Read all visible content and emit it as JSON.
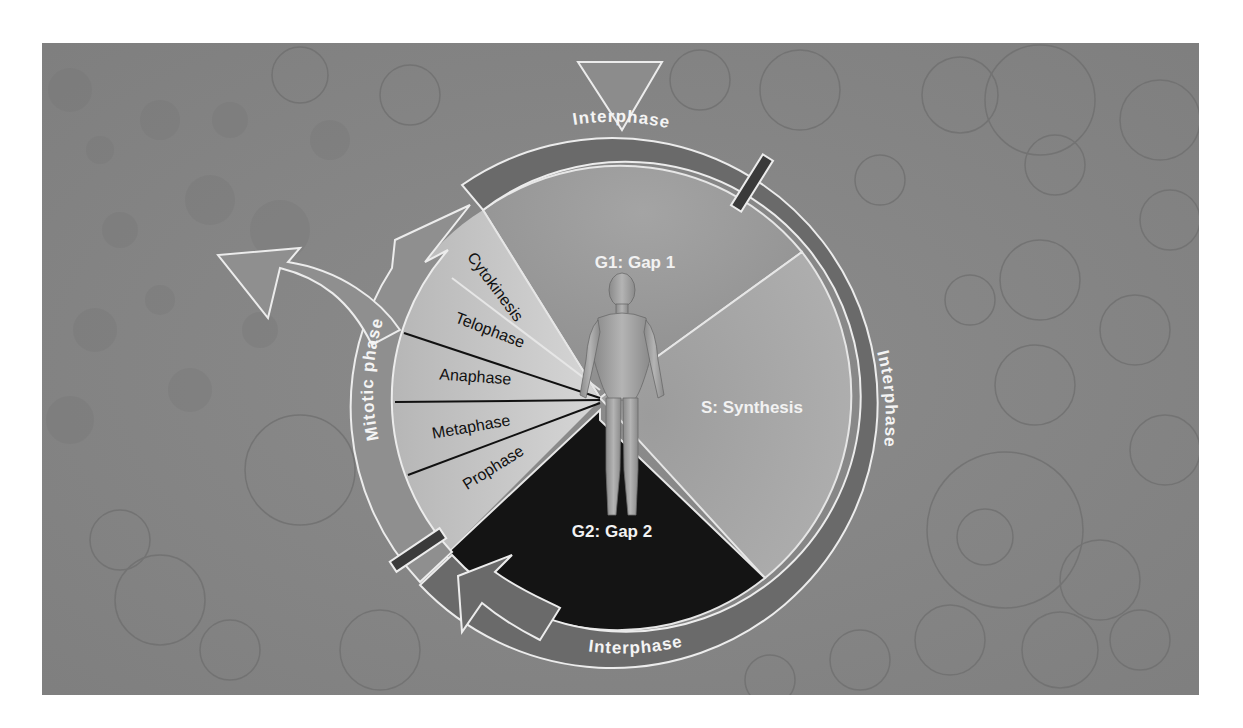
{
  "diagram": {
    "colors": {
      "page_bg": "#ffffff",
      "frame_bg": "#8a8a8a",
      "ring": "#6a6a6a",
      "g1": "#9a9a9a",
      "s": "#a0a0a0",
      "g2": "#141414",
      "mitotic_light": "#c8c8c8",
      "mitotic_arrow": "#8f8f8f",
      "outline": "#ececec",
      "checkpoint": "#3a3a3a"
    },
    "ring_labels": {
      "top": "Interphase",
      "right": "Interphase",
      "bottom": "Interphase",
      "mitotic": "Mitotic phase"
    },
    "interphase_segments": [
      {
        "id": "g1",
        "label": "G1: Gap 1"
      },
      {
        "id": "s",
        "label": "S: Synthesis"
      },
      {
        "id": "g2",
        "label": "G2: Gap 2"
      }
    ],
    "mitotic_segments": [
      {
        "id": "cytokinesis",
        "label": "Cytokinesis"
      },
      {
        "id": "telophase",
        "label": "Telophase"
      },
      {
        "id": "anaphase",
        "label": "Anaphase"
      },
      {
        "id": "metaphase",
        "label": "Metaphase"
      },
      {
        "id": "prophase",
        "label": "Prophase"
      }
    ],
    "center_figure": "human-body-figure"
  }
}
